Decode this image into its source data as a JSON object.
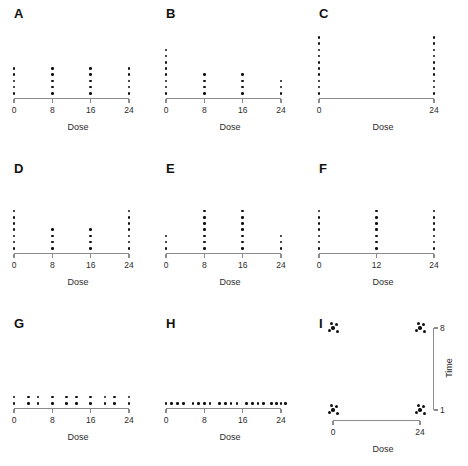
{
  "figure": {
    "type": "dot-diagram-grid",
    "rows": 3,
    "cols": 3,
    "x_axis_title": "Dose",
    "y_axis_title": "Time",
    "dot_color": "#111111",
    "axis_color": "#8c8c8c",
    "background": "#ffffff"
  },
  "chart_data": {
    "type": "scatter",
    "title": "",
    "xlabel": "Dose",
    "ylabel": "Time",
    "panels": [
      {
        "id": "A",
        "label": "A",
        "xlabel": "Dose",
        "xticks": [
          0,
          8,
          16,
          24
        ],
        "xtick_labels": [
          "0",
          "8",
          "16",
          "24"
        ],
        "xlim": [
          0,
          24
        ],
        "design": "balanced-4-dose",
        "x": [
          0,
          8,
          16,
          24
        ],
        "counts": [
          5,
          5,
          5,
          5
        ],
        "total_n": 20
      },
      {
        "id": "B",
        "label": "B",
        "xlabel": "Dose",
        "xticks": [
          0,
          8,
          16,
          24
        ],
        "xtick_labels": [
          "0",
          "8",
          "16",
          "24"
        ],
        "xlim": [
          0,
          24
        ],
        "design": "decreasing-allocation",
        "x": [
          0,
          8,
          16,
          24
        ],
        "counts": [
          8,
          4,
          4,
          3
        ],
        "total_n": 19
      },
      {
        "id": "C",
        "label": "C",
        "xlabel": "Dose",
        "xticks": [
          0,
          24
        ],
        "xtick_labels": [
          "0",
          "24"
        ],
        "xlim": [
          0,
          24
        ],
        "design": "two-extreme-doses",
        "x": [
          0,
          24
        ],
        "counts": [
          10,
          10
        ],
        "total_n": 20
      },
      {
        "id": "D",
        "label": "D",
        "xlabel": "Dose",
        "xticks": [
          0,
          8,
          16,
          24
        ],
        "xtick_labels": [
          "0",
          "8",
          "16",
          "24"
        ],
        "xlim": [
          0,
          24
        ],
        "design": "u-shaped-allocation",
        "x": [
          0,
          8,
          16,
          24
        ],
        "counts": [
          7,
          4,
          4,
          7
        ],
        "total_n": 22
      },
      {
        "id": "E",
        "label": "E",
        "xlabel": "Dose",
        "xticks": [
          0,
          8,
          16,
          24
        ],
        "xtick_labels": [
          "0",
          "8",
          "16",
          "24"
        ],
        "xlim": [
          0,
          24
        ],
        "design": "centre-weighted-allocation",
        "x": [
          0,
          8,
          16,
          24
        ],
        "counts": [
          3,
          7,
          7,
          3
        ],
        "total_n": 20
      },
      {
        "id": "F",
        "label": "F",
        "xlabel": "Dose",
        "xticks": [
          0,
          12,
          24
        ],
        "xtick_labels": [
          "0",
          "12",
          "24"
        ],
        "xlim": [
          0,
          24
        ],
        "design": "three-dose-balanced",
        "x": [
          0,
          12,
          24
        ],
        "counts": [
          7,
          7,
          7
        ],
        "total_n": 21
      },
      {
        "id": "G",
        "label": "G",
        "xlabel": "Dose",
        "xticks": [
          0,
          8,
          16,
          24
        ],
        "xtick_labels": [
          "0",
          "8",
          "16",
          "24"
        ],
        "xlim": [
          0,
          24
        ],
        "design": "many-doses-two-per-dose",
        "x": [
          0,
          3,
          5,
          8,
          11,
          13,
          16,
          19,
          21,
          24
        ],
        "counts": [
          2,
          2,
          2,
          2,
          2,
          2,
          2,
          2,
          2,
          2
        ],
        "total_n": 20
      },
      {
        "id": "H",
        "label": "H",
        "xlabel": "Dose",
        "xticks": [
          0,
          8,
          16,
          24
        ],
        "xtick_labels": [
          "0",
          "8",
          "16",
          "24"
        ],
        "xlim": [
          0,
          24
        ],
        "design": "one-subject-per-dose",
        "x": [
          0,
          1.2,
          2.4,
          3.6,
          5.6,
          6.8,
          8,
          9.2,
          11.2,
          12.4,
          13.6,
          14.8,
          16.8,
          18,
          19.2,
          20.4,
          22,
          23,
          24,
          25
        ],
        "counts": [
          1,
          1,
          1,
          1,
          1,
          1,
          1,
          1,
          1,
          1,
          1,
          1,
          1,
          1,
          1,
          1,
          1,
          1,
          1,
          1
        ],
        "total_n": 20
      },
      {
        "id": "I",
        "label": "I",
        "xlabel": "Dose",
        "ylabel": "Time",
        "xticks": [
          0,
          24
        ],
        "xtick_labels": [
          "0",
          "24"
        ],
        "yticks": [
          1,
          8
        ],
        "ytick_labels": [
          "1",
          "8"
        ],
        "xlim": [
          0,
          24
        ],
        "ylim": [
          1,
          8
        ],
        "design": "dose-by-time-factorial",
        "clusters": [
          {
            "dose": 0,
            "time": 8,
            "n": 5
          },
          {
            "dose": 24,
            "time": 8,
            "n": 5
          },
          {
            "dose": 0,
            "time": 1,
            "n": 5
          },
          {
            "dose": 24,
            "time": 1,
            "n": 5
          }
        ],
        "total_n": 20
      }
    ]
  }
}
